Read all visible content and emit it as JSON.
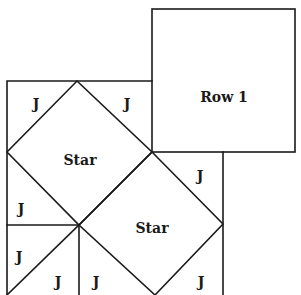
{
  "diagram": {
    "line_color": "#1a1a1a",
    "background": "#ffffff",
    "blocks": {
      "row1": {
        "label": "Row 1"
      },
      "star1": {
        "label": "Star"
      },
      "star2": {
        "label": "Star"
      }
    },
    "pieces": [
      {
        "label": "J"
      },
      {
        "label": "J"
      },
      {
        "label": "J"
      },
      {
        "label": "J"
      },
      {
        "label": "J"
      },
      {
        "label": "J"
      },
      {
        "label": "J"
      },
      {
        "label": "J"
      }
    ]
  }
}
